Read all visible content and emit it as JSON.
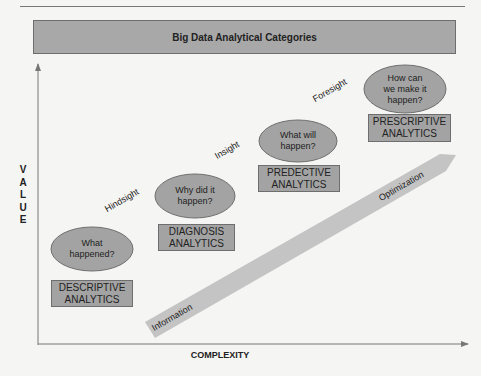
{
  "title": "Big Data Analytical Categories",
  "axes": {
    "y_label": "VALUE",
    "y_letters": [
      "V",
      "A",
      "L",
      "U",
      "E"
    ],
    "x_label": "COMPLEXITY"
  },
  "stages": [
    {
      "question": "What happened?",
      "question_lines": [
        "What",
        "happened?"
      ],
      "category": "DESCRIPTIVE ANALYTICS",
      "category_lines": [
        "DESCRIPTIVE",
        "ANALYTICS"
      ]
    },
    {
      "question": "Why did it happen?",
      "question_lines": [
        "Why did it",
        "happen?"
      ],
      "category": "DIAGNOSIS ANALYTICS",
      "category_lines": [
        "DIAGNOSIS",
        "ANALYTICS"
      ]
    },
    {
      "question": "What will happen?",
      "question_lines": [
        "What will",
        "happen?"
      ],
      "category": "PREDECTIVE ANALYTICS",
      "category_lines": [
        "PREDECTIVE",
        "ANALYTICS"
      ]
    },
    {
      "question": "How can we make it happen?",
      "question_lines": [
        "How can",
        "we make it",
        "happen?"
      ],
      "category": "PRESCRIPTIVE ANALYTICS",
      "category_lines": [
        "PRESCRIPTIVE",
        "ANALYTICS"
      ]
    }
  ],
  "transitions": [
    "Hindsight",
    "Insight",
    "Foresight"
  ],
  "band": {
    "start_label": "Information",
    "end_label": "Optimization"
  },
  "colors": {
    "fill_gray": "#a3a3a3",
    "band_gray": "#c4c4c4",
    "border": "#6e6e6e",
    "axis": "#777777"
  }
}
